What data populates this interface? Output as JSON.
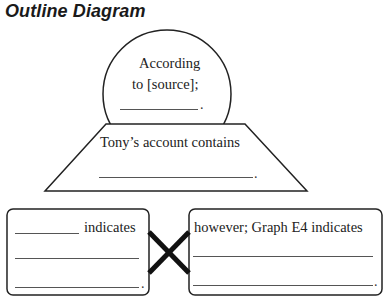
{
  "title": "Outline Diagram",
  "circle": {
    "line1": "According",
    "line2": "to [source];",
    "end_punct": "."
  },
  "trapezoid": {
    "line1": "Tony’s account contains",
    "end_punct": "."
  },
  "left_box": {
    "line1_suffix": "indicates",
    "end_punct": "."
  },
  "right_box": {
    "line1": "however; Graph E4 indicates",
    "end_punct": "."
  },
  "colors": {
    "stroke": "#222222",
    "blank_line": "#555555",
    "text": "#222222"
  }
}
